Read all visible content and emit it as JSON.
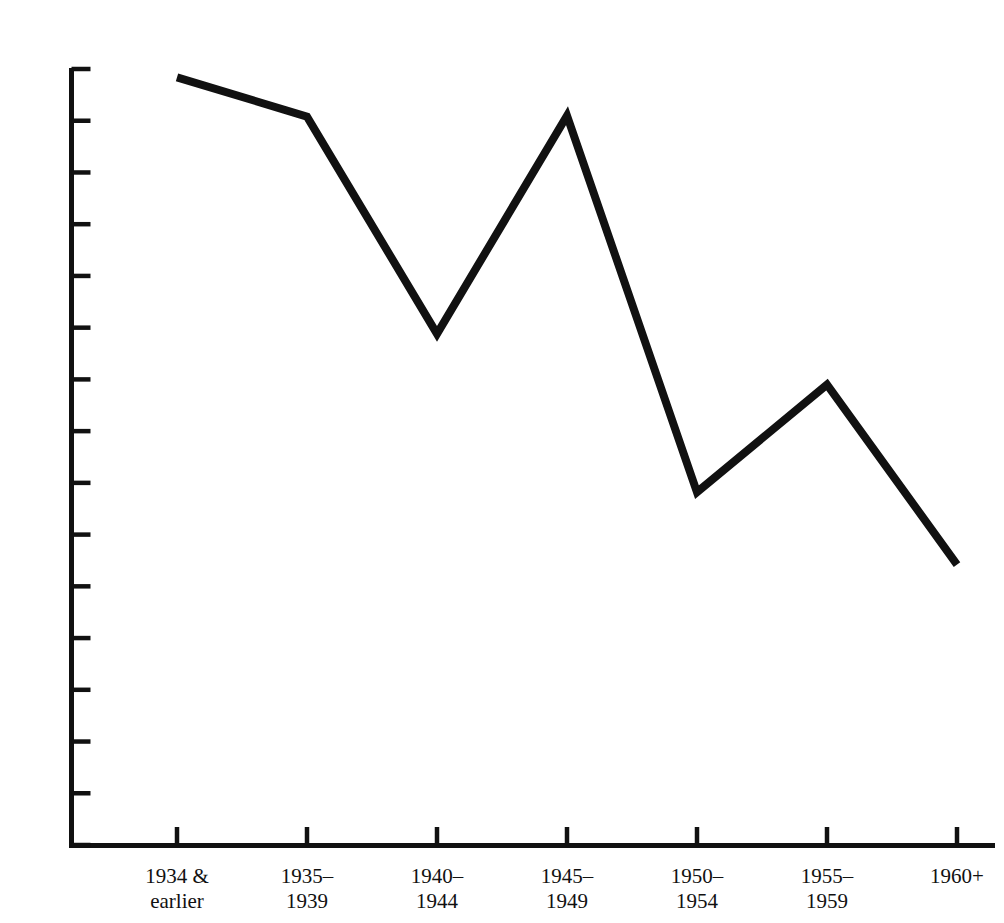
{
  "chart_data": {
    "type": "line",
    "title": "",
    "subtitle": "",
    "xlabel": "",
    "ylabel": "",
    "categories": [
      "1934 &\nearlier",
      "1935–\n1939",
      "1940–\n1944",
      "1945–\n1949",
      "1950–\n1954",
      "1955–\n1959",
      "1960+"
    ],
    "values": [
      74.2,
      70.4,
      49.4,
      70.5,
      34.1,
      44.5,
      27.1
    ],
    "series": [
      {
        "name": "Percent",
        "values": [
          74.2,
          70.4,
          49.4,
          70.5,
          34.1,
          44.5,
          27.1
        ]
      }
    ],
    "ylim": [
      0,
      75
    ],
    "ytick_values": [
      0,
      5,
      10,
      15,
      20,
      25,
      30,
      35,
      40,
      45,
      50,
      55,
      60,
      65,
      70,
      75
    ],
    "ytick_labels": [
      "0",
      "5",
      "10",
      "15",
      "20",
      "25",
      "30",
      "35",
      "40",
      "45",
      "50",
      "55",
      "60",
      "65",
      "70",
      "75%"
    ],
    "grid": false,
    "legend": null,
    "legend_position": "none",
    "annotations": [],
    "line_color": "#111111",
    "line_width_px": 8,
    "axis_color": "#111111",
    "background_color": "#ffffff"
  },
  "axes": {
    "y_axis_name": "percent-axis",
    "x_axis_name": "year-cohort-axis"
  }
}
